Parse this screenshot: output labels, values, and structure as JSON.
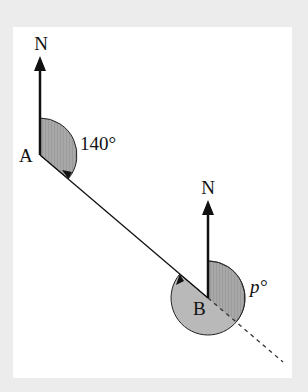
{
  "diagram": {
    "type": "bearing",
    "points": {
      "A": {
        "label": "A",
        "north_label": "N"
      },
      "B": {
        "label": "B",
        "north_label": "N"
      }
    },
    "angles": {
      "at_A": {
        "label": "140°",
        "value": 140
      },
      "at_B": {
        "label": "p°",
        "variable": "p"
      }
    },
    "colors": {
      "background": "#ececec",
      "panel": "#ffffff",
      "shade": "#b4b4b4",
      "shade_dark": "#9a9a9a",
      "line": "#111111"
    }
  }
}
